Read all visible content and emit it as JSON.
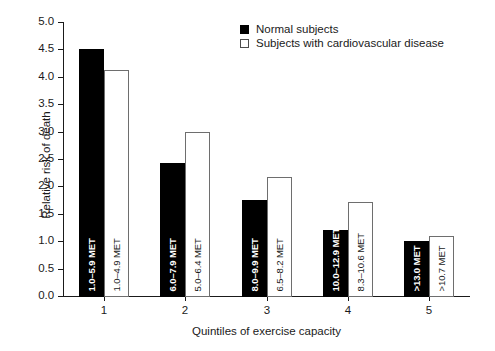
{
  "chart_data": {
    "type": "bar",
    "title": "",
    "xlabel": "Quintiles of exercise capacity",
    "ylabel": "Relative risk of death",
    "categories": [
      "1",
      "2",
      "3",
      "4",
      "5"
    ],
    "ylim": [
      0.0,
      5.0
    ],
    "ytick_labels": [
      "0.0",
      "0.5",
      "1.0",
      "1.5",
      "2.0",
      "2.5",
      "3.0",
      "3.5",
      "4.0",
      "4.5",
      "5.0"
    ],
    "ytick_values": [
      0.0,
      0.5,
      1.0,
      1.5,
      2.0,
      2.5,
      3.0,
      3.5,
      4.0,
      4.5,
      5.0
    ],
    "grid": false,
    "legend_position": "top-center",
    "series": [
      {
        "name": "Normal subjects",
        "fill": "#000000",
        "values": [
          4.5,
          2.42,
          1.75,
          1.2,
          1.0
        ],
        "point_labels": [
          "1.0–5.9 MET",
          "6.0–7.9 MET",
          "8.0–9.9 MET",
          "10.0–12.9 MET",
          ">13.0 MET"
        ]
      },
      {
        "name": "Subjects with cardiovascular disease",
        "fill": "#ffffff",
        "values": [
          4.12,
          2.99,
          2.17,
          1.72,
          1.1
        ],
        "point_labels": [
          "1.0–4.9 MET",
          "5.0–6.4 MET",
          "6.5–8.2 MET",
          "8.3–10.6 MET",
          ">10.7 MET"
        ]
      }
    ]
  },
  "legend": {
    "items": [
      {
        "label": "Normal subjects",
        "swatch": "normal"
      },
      {
        "label": "Subjects with cardiovascular disease",
        "swatch": "cvd"
      }
    ]
  }
}
